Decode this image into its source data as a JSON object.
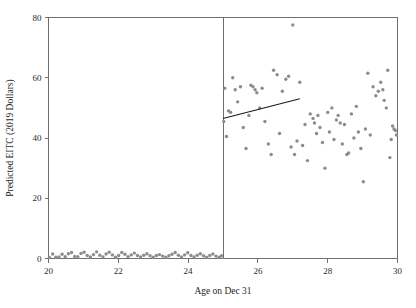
{
  "chart_data": {
    "type": "scatter",
    "title": "",
    "xlabel": "Age on Dec 31",
    "ylabel": "Predicted EITC (2019 Dollars)",
    "xlim": [
      20,
      30
    ],
    "ylim": [
      0,
      80
    ],
    "xticks": [
      20,
      22,
      24,
      26,
      28,
      30
    ],
    "yticks": [
      0,
      20,
      40,
      60,
      80
    ],
    "xtick_labels": [
      "20",
      "22",
      "24",
      "26",
      "28",
      "30"
    ],
    "ytick_labels": [
      "0",
      "20",
      "40",
      "60",
      "80"
    ],
    "grid": false,
    "legend": "none",
    "annotations": [
      {
        "name": "discontinuity-cutoff",
        "type": "vline",
        "x": 25.0
      }
    ],
    "series": [
      {
        "name": "Left of cutoff (age < 25)",
        "marker": "circle",
        "color": "#8c8c8c",
        "points": [
          [
            20.03,
            0.3
          ],
          [
            20.12,
            1.5
          ],
          [
            20.21,
            0.4
          ],
          [
            20.3,
            0.5
          ],
          [
            20.39,
            1.4
          ],
          [
            20.48,
            0.6
          ],
          [
            20.57,
            1.6
          ],
          [
            20.66,
            2.0
          ],
          [
            20.75,
            0.7
          ],
          [
            20.84,
            0.6
          ],
          [
            20.93,
            1.7
          ],
          [
            21.02,
            2.1
          ],
          [
            21.11,
            1.0
          ],
          [
            21.2,
            0.5
          ],
          [
            21.29,
            1.3
          ],
          [
            21.38,
            2.2
          ],
          [
            21.47,
            1.1
          ],
          [
            21.56,
            0.5
          ],
          [
            21.65,
            1.5
          ],
          [
            21.74,
            2.1
          ],
          [
            21.83,
            1.2
          ],
          [
            21.92,
            0.4
          ],
          [
            22.01,
            1.0
          ],
          [
            22.1,
            2.0
          ],
          [
            22.19,
            1.4
          ],
          [
            22.28,
            0.6
          ],
          [
            22.37,
            1.2
          ],
          [
            22.46,
            1.8
          ],
          [
            22.55,
            1.0
          ],
          [
            22.64,
            0.5
          ],
          [
            22.73,
            1.1
          ],
          [
            22.82,
            1.6
          ],
          [
            22.91,
            0.9
          ],
          [
            23.0,
            0.4
          ],
          [
            23.09,
            1.0
          ],
          [
            23.18,
            1.3
          ],
          [
            23.27,
            0.8
          ],
          [
            23.36,
            0.4
          ],
          [
            23.45,
            0.9
          ],
          [
            23.54,
            1.4
          ],
          [
            23.63,
            2.0
          ],
          [
            23.72,
            1.1
          ],
          [
            23.81,
            0.5
          ],
          [
            23.9,
            1.2
          ],
          [
            23.99,
            1.9
          ],
          [
            24.08,
            1.0
          ],
          [
            24.17,
            0.5
          ],
          [
            24.26,
            1.1
          ],
          [
            24.35,
            1.6
          ],
          [
            24.44,
            0.9
          ],
          [
            24.53,
            0.4
          ],
          [
            24.62,
            1.0
          ],
          [
            24.71,
            1.5
          ],
          [
            24.8,
            0.8
          ],
          [
            24.89,
            0.4
          ],
          [
            24.96,
            0.9
          ]
        ]
      },
      {
        "name": "Right of cutoff (age >= 25)",
        "marker": "circle",
        "color": "#8c8c8c",
        "points": [
          [
            25.02,
            45.5
          ],
          [
            25.05,
            56.5
          ],
          [
            25.1,
            40.5
          ],
          [
            25.16,
            49.0
          ],
          [
            25.22,
            48.5
          ],
          [
            25.28,
            60.0
          ],
          [
            25.35,
            56.0
          ],
          [
            25.42,
            52.0
          ],
          [
            25.5,
            57.0
          ],
          [
            25.58,
            43.5
          ],
          [
            25.66,
            36.5
          ],
          [
            25.74,
            47.5
          ],
          [
            25.8,
            57.5
          ],
          [
            25.86,
            57.0
          ],
          [
            25.92,
            56.0
          ],
          [
            25.97,
            55.0
          ],
          [
            26.05,
            50.0
          ],
          [
            26.12,
            56.5
          ],
          [
            26.2,
            45.5
          ],
          [
            26.3,
            38.0
          ],
          [
            26.38,
            34.5
          ],
          [
            26.45,
            62.5
          ],
          [
            26.55,
            61.0
          ],
          [
            26.62,
            41.5
          ],
          [
            26.7,
            55.5
          ],
          [
            26.8,
            59.5
          ],
          [
            26.88,
            60.5
          ],
          [
            26.95,
            37.0
          ],
          [
            27.0,
            77.5
          ],
          [
            27.05,
            34.5
          ],
          [
            27.12,
            39.0
          ],
          [
            27.2,
            58.5
          ],
          [
            27.28,
            37.5
          ],
          [
            27.35,
            44.5
          ],
          [
            27.42,
            32.5
          ],
          [
            27.5,
            48.0
          ],
          [
            27.58,
            46.5
          ],
          [
            27.62,
            45.0
          ],
          [
            27.68,
            41.5
          ],
          [
            27.72,
            47.5
          ],
          [
            27.78,
            43.5
          ],
          [
            27.85,
            38.5
          ],
          [
            27.92,
            30.0
          ],
          [
            28.0,
            48.5
          ],
          [
            28.05,
            42.0
          ],
          [
            28.12,
            50.0
          ],
          [
            28.18,
            39.5
          ],
          [
            28.25,
            46.0
          ],
          [
            28.3,
            47.5
          ],
          [
            28.36,
            45.0
          ],
          [
            28.42,
            38.0
          ],
          [
            28.48,
            44.5
          ],
          [
            28.55,
            34.5
          ],
          [
            28.6,
            35.0
          ],
          [
            28.68,
            48.0
          ],
          [
            28.75,
            40.0
          ],
          [
            28.82,
            50.5
          ],
          [
            28.88,
            42.0
          ],
          [
            28.95,
            36.5
          ],
          [
            29.02,
            25.5
          ],
          [
            29.08,
            43.0
          ],
          [
            29.15,
            61.5
          ],
          [
            29.22,
            41.0
          ],
          [
            29.3,
            57.0
          ],
          [
            29.38,
            54.0
          ],
          [
            29.45,
            55.5
          ],
          [
            29.52,
            58.5
          ],
          [
            29.58,
            56.0
          ],
          [
            29.62,
            52.5
          ],
          [
            29.68,
            50.0
          ],
          [
            29.72,
            62.5
          ],
          [
            29.78,
            33.5
          ],
          [
            29.82,
            39.5
          ],
          [
            29.86,
            44.0
          ],
          [
            29.9,
            43.0
          ],
          [
            29.94,
            42.5
          ],
          [
            29.97,
            41.0
          ]
        ]
      }
    ],
    "fit_line": {
      "name": "right-side-fit",
      "color": "#1a1a1a",
      "x_start": 25.0,
      "y_start": 46.5,
      "x_end": 27.2,
      "y_end": 53.0
    }
  }
}
